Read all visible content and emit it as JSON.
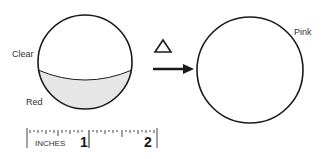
{
  "diagram": {
    "left_sphere": {
      "top_label": "Clear",
      "bottom_label": "Red",
      "fill_bottom": "#e6e6e6"
    },
    "transition": {
      "symbol": "Δ",
      "symbol_meaning": "heat"
    },
    "right_sphere": {
      "label": "Pink"
    },
    "ruler": {
      "unit_label": "INCHES",
      "marks": [
        "1",
        "2"
      ]
    },
    "colors": {
      "stroke": "#1a1a1a",
      "text": "#333333"
    }
  }
}
